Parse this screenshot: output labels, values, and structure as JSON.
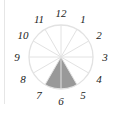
{
  "figure": {
    "type": "clock-fraction-diagram",
    "divisions": 12,
    "labels": [
      "12",
      "1",
      "2",
      "3",
      "4",
      "5",
      "6",
      "7",
      "8",
      "9",
      "10",
      "11"
    ],
    "shaded_from": 5,
    "shaded_to": 7,
    "shaded_sectors": 2,
    "colors": {
      "shade": "#999999",
      "lines": "#e2e2e2",
      "text": "#222222"
    }
  }
}
